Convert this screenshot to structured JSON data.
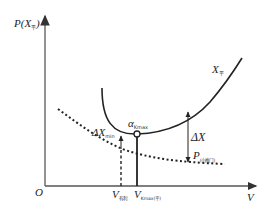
{
  "diagram": {
    "y_axis_label": "P(X",
    "y_axis_label_sub": "平",
    "y_axis_label_close": ")",
    "x_axis_label": "V",
    "origin_label": "O",
    "curve_solid_label": "X",
    "curve_solid_label_sub": "平",
    "min_point_label": "α",
    "min_point_label_sub": "Kmax",
    "delta_min_label": "ΔX",
    "delta_min_label_sub": "min",
    "delta_label": "ΔX",
    "dotted_curve_label": "P",
    "dotted_curve_label_sub": "(小推门)",
    "v1_label": "V",
    "v1_label_sub": "有利",
    "v2_label": "V",
    "v2_label_sub": "Kmax(平)"
  },
  "colors": {
    "axis": "#777777",
    "curve": "#222222",
    "text": "#222222"
  }
}
